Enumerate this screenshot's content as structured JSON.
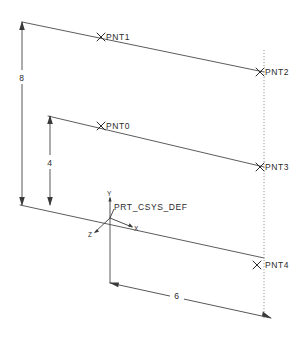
{
  "drawing": {
    "title": "Datum Point Sketch",
    "background_color": "#ffffff",
    "line_color": "#4a4a4a",
    "text_color": "#2b2b2b",
    "datum_color": "#8c8c8c"
  },
  "points": [
    {
      "id": "pnt1",
      "label": "PNT1",
      "marker": "x-cross"
    },
    {
      "id": "pnt2",
      "label": "PNT2",
      "marker": "x-cross"
    },
    {
      "id": "pnt0",
      "label": "PNT0",
      "marker": "x-cross"
    },
    {
      "id": "pnt3",
      "label": "PNT3",
      "marker": "x-cross"
    },
    {
      "id": "pnt4",
      "label": "PNT4",
      "marker": "x-cross"
    }
  ],
  "dimensions": [
    {
      "id": "dim-height-8",
      "value": "8",
      "orientation": "vertical"
    },
    {
      "id": "dim-height-4",
      "value": "4",
      "orientation": "vertical"
    },
    {
      "id": "dim-width-6",
      "value": "6",
      "orientation": "horizontal"
    }
  ],
  "csys": {
    "name": "PRT_CSYS_DEF",
    "axes": [
      {
        "id": "axis-y",
        "label": "Y"
      },
      {
        "id": "axis-x",
        "label": "X"
      },
      {
        "id": "axis-z",
        "label": "Z"
      }
    ]
  }
}
